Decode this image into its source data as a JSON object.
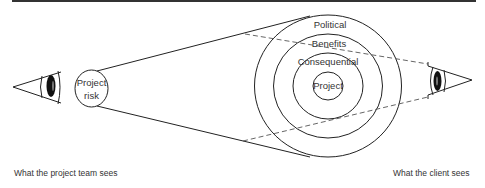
{
  "diagram": {
    "top_rule_color": "#333333",
    "left_viewer": {
      "label": "What the project team sees",
      "focus": {
        "line1": "Project",
        "line2": "risk"
      }
    },
    "right_viewer": {
      "label": "What the client sees"
    },
    "rings": [
      {
        "name": "Political",
        "label": "Political"
      },
      {
        "name": "Benefits",
        "label": "Benefits"
      },
      {
        "name": "Consequential",
        "label": "Consequential"
      },
      {
        "name": "Project",
        "label": "Project"
      }
    ]
  }
}
